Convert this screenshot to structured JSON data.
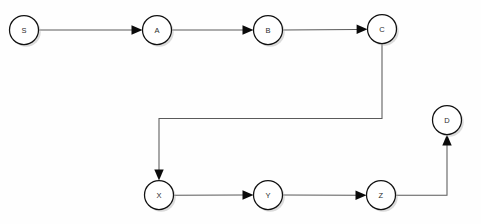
{
  "diagram": {
    "background_color": "#fefefe",
    "node_fill_color": "#ffffff",
    "node_stroke_color": "#111111",
    "edge_color": "#5a5a5a",
    "arrow_color": "#0a0a0a",
    "label_color": "#2b2b2b",
    "node_radius": 14.5,
    "nodes": [
      {
        "id": "S",
        "label": "S",
        "cx": 24,
        "cy": 30
      },
      {
        "id": "A",
        "label": "A",
        "cx": 157,
        "cy": 30
      },
      {
        "id": "B",
        "label": "B",
        "cx": 268,
        "cy": 30
      },
      {
        "id": "C",
        "label": "C",
        "cx": 382,
        "cy": 29
      },
      {
        "id": "D",
        "label": "D",
        "cx": 447,
        "cy": 120
      },
      {
        "id": "X",
        "label": "X",
        "cx": 159,
        "cy": 195
      },
      {
        "id": "Y",
        "label": "Y",
        "cx": 268,
        "cy": 195
      },
      {
        "id": "Z",
        "label": "Z",
        "cx": 381,
        "cy": 195
      }
    ],
    "edges": [
      {
        "id": "S-A",
        "from": "S",
        "to": "A",
        "label": "",
        "routing": "straight-horizontal"
      },
      {
        "id": "A-B",
        "from": "A",
        "to": "B",
        "label": "",
        "routing": "straight-horizontal"
      },
      {
        "id": "B-C",
        "from": "B",
        "to": "C",
        "label": "",
        "routing": "straight-horizontal"
      },
      {
        "id": "C-X",
        "from": "C",
        "to": "X",
        "label": "",
        "routing": "orthogonal-down-left-down"
      },
      {
        "id": "X-Y",
        "from": "X",
        "to": "Y",
        "label": "",
        "routing": "straight-horizontal"
      },
      {
        "id": "Y-Z",
        "from": "Y",
        "to": "Z",
        "label": "",
        "routing": "straight-horizontal"
      },
      {
        "id": "Z-D",
        "from": "Z",
        "to": "D",
        "label": "",
        "routing": "orthogonal-right-up"
      }
    ]
  }
}
